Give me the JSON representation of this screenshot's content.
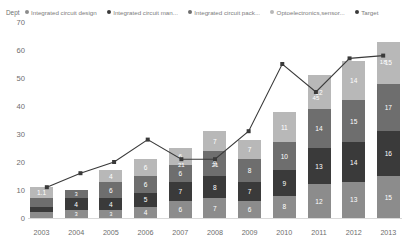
{
  "legend": {
    "dept_label": "Dept",
    "items": [
      {
        "label": "Integrated circuit design",
        "color": "#8c8c8c",
        "icon": "legend-dot-icon"
      },
      {
        "label": "Integrated circuit man...",
        "color": "#3a3a3a",
        "icon": "legend-dot-icon"
      },
      {
        "label": "Integrated circuit pack...",
        "color": "#6e6e6e",
        "icon": "legend-dot-icon"
      },
      {
        "label": "Optoelectronics,sensor...",
        "color": "#b8b8b8",
        "icon": "legend-dot-icon"
      },
      {
        "label": "Target",
        "color": "#3a3a3a",
        "icon": "legend-dot-icon"
      }
    ]
  },
  "chart_data": {
    "type": "bar",
    "title": "",
    "xlabel": "",
    "ylabel": "",
    "ylim": [
      0,
      70
    ],
    "yticks": [
      0,
      10,
      20,
      30,
      40,
      50,
      60,
      70
    ],
    "grid": false,
    "stacked": true,
    "legend_position": "top",
    "categories": [
      "2003",
      "2004",
      "2005",
      "2006",
      "2007",
      "2008",
      "2009",
      "2010",
      "2011",
      "2012",
      "2013"
    ],
    "series": [
      {
        "name": "Integrated circuit design",
        "color": "#8c8c8c",
        "values": [
          2,
          3,
          3,
          4,
          6,
          7,
          6,
          8,
          12,
          13,
          15
        ],
        "labels": [
          "",
          "3",
          "3",
          "4",
          "6",
          "7",
          "6",
          "8",
          "12",
          "13",
          "15"
        ]
      },
      {
        "name": "Integrated circuit man...",
        "color": "#3a3a3a",
        "values": [
          2,
          4,
          4,
          5,
          7,
          8,
          7,
          9,
          13,
          14,
          16
        ],
        "labels": [
          "",
          "4",
          "4",
          "5",
          "7",
          "8",
          "7",
          "9",
          "13",
          "14",
          "16"
        ]
      },
      {
        "name": "Integrated circuit pack...",
        "color": "#6e6e6e",
        "values": [
          3,
          3,
          6,
          6,
          6,
          9,
          8,
          10,
          14,
          15,
          17
        ],
        "labels": [
          "",
          "3",
          "6",
          "6",
          "6",
          "9",
          "8",
          "10",
          "14",
          "15",
          "17"
        ]
      },
      {
        "name": "Optoelectronics,sensor...",
        "color": "#b8b8b8",
        "values": [
          4,
          0,
          4,
          6,
          6,
          7,
          7,
          11,
          12,
          14,
          15
        ],
        "labels": [
          "1.1",
          "",
          "4",
          "6",
          "6",
          "7",
          "7",
          "11",
          "12",
          "14",
          "15"
        ]
      }
    ],
    "target": {
      "name": "Target",
      "color": "#3a3a3a",
      "marker": "square",
      "values": [
        11,
        16,
        20,
        28,
        21,
        21,
        31,
        55,
        45,
        57,
        58
      ],
      "labels": [
        "",
        "",
        "",
        "",
        "21",
        "21",
        "",
        "",
        "45",
        "",
        "18"
      ]
    }
  }
}
